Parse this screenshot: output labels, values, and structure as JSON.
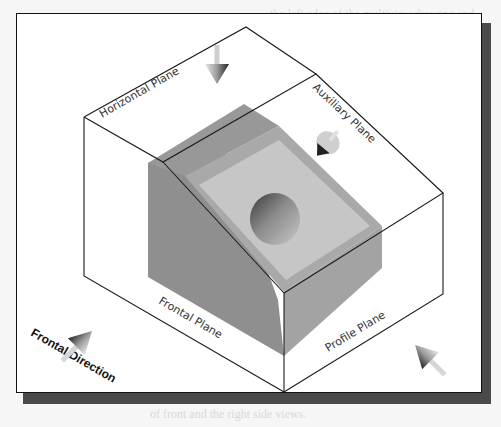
{
  "figure": {
    "labels": {
      "horizontal_plane": "Horizontal Plane",
      "auxiliary_plane": "Auxiliary Plane",
      "frontal_plane": "Frontal Plane",
      "profile_plane": "Profile Plane",
      "frontal_direction": "Frontal Direction"
    },
    "arrows": [
      {
        "name": "horizontal-view-arrow",
        "direction": "down"
      },
      {
        "name": "auxiliary-view-arrow",
        "direction": "down-left, normal to inclined plane"
      },
      {
        "name": "frontal-view-arrow",
        "direction": "up-right"
      },
      {
        "name": "profile-view-arrow",
        "direction": "up-left"
      }
    ],
    "colors": {
      "frame_bg": "#ffffff",
      "frame_border": "#111111",
      "shadow": "#4a4a4a",
      "object_dark": "#8f8f8f",
      "object_mid": "#a6a6a6",
      "object_light": "#c4c4c4",
      "hole": "#7d7d7d",
      "edge": "#1a1a1a"
    }
  },
  "background_text": [
    "the left edge of the multiview drawing and",
    "... Note especially that many of",
    "projection are parallel to the box. In thi",
    "and (3) each other.",
    "be with the projection plane while look at",
    "is the other so that in the box. Isolate",
    "together so that the view is rotated into",
    "when parallel. Label the drawing surface.",
    "are constructed in a plane perpendicular",
    "the view and we look. This multiview drawing",
    "be a multiview drawing as shown in the same",
    "the view is parallel to the drawing surface",
    "is constructed from one of the",
    "is parallel to the perpendicular",
    "and rotated to the inclined plane",
    "along these principal planes",
    "measured to show true size",
    "all the views are drawn to scale",
    "of front and the right side views."
  ]
}
